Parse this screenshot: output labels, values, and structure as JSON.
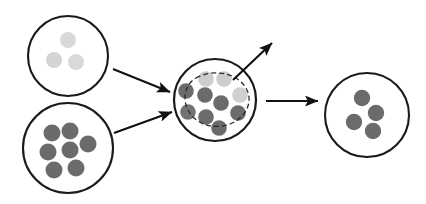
{
  "canvas": {
    "width": 426,
    "height": 204,
    "background": "#ffffff"
  },
  "palette": {
    "outline": "#1a1a1a",
    "dot_light": "#d9d9d9",
    "dot_light_mid": "#c9c9c9",
    "dot_dark": "#6b6b6b",
    "dot_dark_alt": "#787878",
    "dashed_outline": "#2b2b2b",
    "arrow": "#111111"
  },
  "diagram": {
    "type": "mixing-schematic",
    "title": "",
    "circles": [
      {
        "id": "source-light",
        "name": "top-left-circle",
        "cx": 68,
        "cy": 56,
        "r": 40,
        "stroke": "#1a1a1a",
        "stroke_width": 2.1,
        "fill": "#ffffff",
        "particle_count": 3,
        "particles": [
          {
            "cx": 68,
            "cy": 40,
            "r": 8.0,
            "fill": "#d9d9d9"
          },
          {
            "cx": 54,
            "cy": 60,
            "r": 8.0,
            "fill": "#d4d4d4"
          },
          {
            "cx": 76,
            "cy": 62,
            "r": 8.0,
            "fill": "#d9d9d9"
          }
        ]
      },
      {
        "id": "source-dark",
        "name": "bottom-left-circle",
        "cx": 68,
        "cy": 148,
        "r": 45,
        "stroke": "#1a1a1a",
        "stroke_width": 2.1,
        "fill": "#ffffff",
        "particle_count": 7,
        "particles": [
          {
            "cx": 52,
            "cy": 133,
            "r": 8.5,
            "fill": "#6b6b6b"
          },
          {
            "cx": 70,
            "cy": 131,
            "r": 8.5,
            "fill": "#6b6b6b"
          },
          {
            "cx": 88,
            "cy": 144,
            "r": 8.5,
            "fill": "#6b6b6b"
          },
          {
            "cx": 48,
            "cy": 152,
            "r": 8.5,
            "fill": "#6b6b6b"
          },
          {
            "cx": 70,
            "cy": 150,
            "r": 8.5,
            "fill": "#6b6b6b"
          },
          {
            "cx": 54,
            "cy": 170,
            "r": 8.5,
            "fill": "#6b6b6b"
          },
          {
            "cx": 76,
            "cy": 168,
            "r": 8.5,
            "fill": "#6b6b6b"
          }
        ]
      },
      {
        "id": "mixed",
        "name": "middle-circle",
        "cx": 215,
        "cy": 100,
        "r": 41,
        "stroke": "#1a1a1a",
        "stroke_width": 2.2,
        "fill": "#ffffff",
        "particle_count": 13,
        "has_dashed_region": true,
        "particles": [
          {
            "cx": 206,
            "cy": 79,
            "r": 7.8,
            "fill": "#cccccc"
          },
          {
            "cx": 224,
            "cy": 79,
            "r": 7.8,
            "fill": "#cdcdcd"
          },
          {
            "cx": 240,
            "cy": 95,
            "r": 7.8,
            "fill": "#cfcfcf"
          },
          {
            "cx": 186,
            "cy": 91,
            "r": 7.8,
            "fill": "#6b6b6b"
          },
          {
            "cx": 205,
            "cy": 95,
            "r": 7.8,
            "fill": "#6b6b6b"
          },
          {
            "cx": 221,
            "cy": 103,
            "r": 7.8,
            "fill": "#6b6b6b"
          },
          {
            "cx": 188,
            "cy": 112,
            "r": 7.8,
            "fill": "#737373"
          },
          {
            "cx": 206,
            "cy": 117,
            "r": 7.8,
            "fill": "#6b6b6b"
          },
          {
            "cx": 238,
            "cy": 113,
            "r": 7.8,
            "fill": "#6b6b6b"
          },
          {
            "cx": 219,
            "cy": 128,
            "r": 7.8,
            "fill": "#6b6b6b"
          }
        ]
      },
      {
        "id": "product",
        "name": "right-circle",
        "cx": 367,
        "cy": 115,
        "r": 42,
        "stroke": "#1a1a1a",
        "stroke_width": 2.1,
        "fill": "#ffffff",
        "particle_count": 4,
        "particles": [
          {
            "cx": 362,
            "cy": 98,
            "r": 8.2,
            "fill": "#6b6b6b"
          },
          {
            "cx": 376,
            "cy": 113,
            "r": 8.2,
            "fill": "#6b6b6b"
          },
          {
            "cx": 354,
            "cy": 122,
            "r": 8.2,
            "fill": "#6b6b6b"
          },
          {
            "cx": 373,
            "cy": 131,
            "r": 8.2,
            "fill": "#6b6b6b"
          }
        ]
      }
    ],
    "dashed_region": {
      "name": "dashed-subregion",
      "stroke": "#2b2b2b",
      "stroke_width": 1.3,
      "dash_pattern": "5,3",
      "path": "M 196 78 C 206 72, 222 71, 234 77 C 244 82, 250 92, 249 101 C 248 112, 240 120, 230 124 C 219 128, 207 127, 198 121 C 190 116, 185 107, 185 98 C 185 89, 189 82, 196 78 Z"
    },
    "arrows": [
      {
        "id": "arrow-in-top",
        "name": "arrow-top-left-to-middle",
        "x1": 113,
        "y1": 69,
        "x2": 170,
        "y2": 92,
        "stroke": "#111111",
        "stroke_width": 2.1
      },
      {
        "id": "arrow-in-bottom",
        "name": "arrow-bottom-left-to-middle",
        "x1": 114,
        "y1": 133,
        "x2": 172,
        "y2": 112,
        "stroke": "#111111",
        "stroke_width": 2.1
      },
      {
        "id": "arrow-out-up",
        "name": "arrow-middle-upward-exit",
        "x1": 233,
        "y1": 80,
        "x2": 272,
        "y2": 43,
        "stroke": "#111111",
        "stroke_width": 2.1
      },
      {
        "id": "arrow-out-right",
        "name": "arrow-middle-to-right",
        "x1": 266,
        "y1": 101,
        "x2": 318,
        "y2": 101,
        "stroke": "#111111",
        "stroke_width": 2.1
      }
    ]
  }
}
